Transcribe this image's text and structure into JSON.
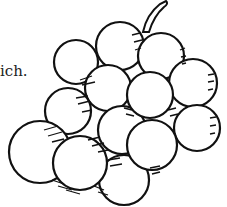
{
  "caption": {
    "text": "ich."
  },
  "illustration": {
    "subject": "bunch of grapes",
    "style": "black ink line drawing",
    "colors": {
      "ink": "#111111",
      "background": "#ffffff"
    },
    "grape_count": 13
  }
}
